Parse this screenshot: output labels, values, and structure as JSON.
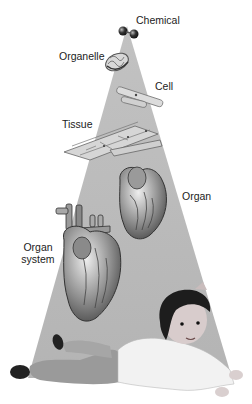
{
  "diagram": {
    "type": "levels-of-organization",
    "colors": {
      "background": "#ffffff",
      "cone": "#b8b8b8",
      "text": "#222222"
    },
    "levels": [
      {
        "id": "chemical",
        "label": "Chemical"
      },
      {
        "id": "organelle",
        "label": "Organelle"
      },
      {
        "id": "cell",
        "label": "Cell"
      },
      {
        "id": "tissue",
        "label": "Tissue"
      },
      {
        "id": "organ",
        "label": "Organ"
      },
      {
        "id": "organ-system",
        "label_line1": "Organ",
        "label_line2": "system"
      },
      {
        "id": "organism",
        "label": ""
      }
    ]
  }
}
